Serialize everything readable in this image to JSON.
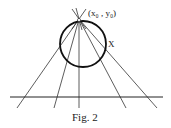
{
  "labels": {
    "point": "(x₀ , y₀)",
    "curve": "X",
    "caption": "Fig. 2"
  },
  "geometry": {
    "apex": [
      79,
      19
    ],
    "circle": {
      "cx": 83,
      "cy": 44,
      "r": 23
    },
    "baseline": {
      "x1": 10,
      "x2": 163,
      "y": 97
    },
    "rays_end_x": [
      17,
      54,
      79,
      126,
      157
    ],
    "rays_end_y": 108
  }
}
